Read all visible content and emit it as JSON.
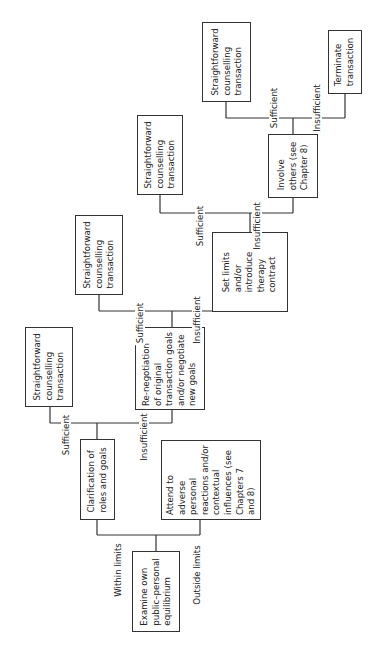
{
  "diagram": {
    "orientation": "rotated-90-ccw",
    "nodes": {
      "examine": "Examine own\npublic–personal\nequilibrium",
      "clarification": "Clarification of\nroles and goals",
      "attend": "Attend to\nadverse\npersonal\nreactions and/or\ncontextual\ninfluences (see\nChapters 7\nand 8)",
      "straight1": "Straightforward\ncounselling\ntransaction",
      "renegotiation": "Re-negotiation\nof original\ntransaction goals\nand/or negotiate\nnew goals",
      "straight2": "Straightforward\ncounselling\ntransaction",
      "setlimits": "Set limits\nand/or\nintroduce\ntherapy\ncontract",
      "straight3": "Straightforward\ncounselling\ntransaction",
      "involve": "Involve\nothers (see\nChapter 8)",
      "straight4": "Straightforward\ncounselling\ntransaction",
      "terminate": "Terminate\ntransaction"
    },
    "edge_labels": {
      "within_limits": "Within limits",
      "outside_limits": "Outside limits",
      "sufficient_1": "Sufficient",
      "insufficient_1": "Insufficient",
      "sufficient_2": "Sufficient",
      "insufficient_2": "Insufficient",
      "sufficient_3": "Sufficient",
      "insufficient_3": "Insufficient",
      "sufficient_4": "Sufficient",
      "insufficient_4": "Insufficient"
    }
  }
}
